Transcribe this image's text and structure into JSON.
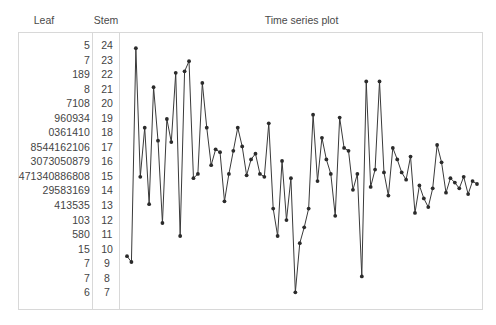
{
  "headers": {
    "leaf": "Leaf",
    "stem": "Stem",
    "plot_title": "Time series plot"
  },
  "stem_leaf": {
    "rows": [
      {
        "stem": "24",
        "leaf": "5"
      },
      {
        "stem": "23",
        "leaf": "7"
      },
      {
        "stem": "22",
        "leaf": "189"
      },
      {
        "stem": "21",
        "leaf": "8"
      },
      {
        "stem": "20",
        "leaf": "7108"
      },
      {
        "stem": "19",
        "leaf": "960934"
      },
      {
        "stem": "18",
        "leaf": "0361410"
      },
      {
        "stem": "17",
        "leaf": "8544162106"
      },
      {
        "stem": "16",
        "leaf": "3073050879"
      },
      {
        "stem": "15",
        "leaf": "471340886808"
      },
      {
        "stem": "14",
        "leaf": "29583169"
      },
      {
        "stem": "13",
        "leaf": "413535"
      },
      {
        "stem": "12",
        "leaf": "103"
      },
      {
        "stem": "11",
        "leaf": "580"
      },
      {
        "stem": "10",
        "leaf": "15"
      },
      {
        "stem": "9",
        "leaf": "7"
      },
      {
        "stem": "8",
        "leaf": "7"
      },
      {
        "stem": "7",
        "leaf": "6"
      }
    ]
  },
  "chart_data": {
    "type": "line",
    "title": "Time series plot",
    "xlabel": "",
    "ylabel": "",
    "grid": false,
    "legend": null,
    "marker": "filled-circle",
    "line_color": "#3a3a3a",
    "marker_color": "#2b2b2b",
    "ylim": [
      70,
      250
    ],
    "xlim": [
      1,
      80
    ],
    "x": [
      1,
      2,
      3,
      4,
      5,
      6,
      7,
      8,
      9,
      10,
      11,
      12,
      13,
      14,
      15,
      16,
      17,
      18,
      19,
      20,
      21,
      22,
      23,
      24,
      25,
      26,
      27,
      28,
      29,
      30,
      31,
      32,
      33,
      34,
      35,
      36,
      37,
      38,
      39,
      40,
      41,
      42,
      43,
      44,
      45,
      46,
      47,
      48,
      49,
      50,
      51,
      52,
      53,
      54,
      55,
      56,
      57,
      58,
      59,
      60,
      61,
      62,
      63,
      64,
      65,
      66,
      67,
      68,
      69,
      70,
      71,
      72,
      73,
      74,
      75,
      76,
      77,
      78,
      79,
      80
    ],
    "values": [
      101,
      97,
      245,
      156,
      190,
      137,
      218,
      181,
      124,
      196,
      180,
      228,
      115,
      229,
      236,
      155,
      158,
      221,
      190,
      164,
      175,
      173,
      139,
      158,
      174,
      190,
      177,
      157,
      168,
      172,
      158,
      156,
      193,
      134,
      115,
      167,
      126,
      155,
      76,
      110,
      121,
      134,
      199,
      153,
      183,
      168,
      158,
      129,
      197,
      176,
      174,
      147,
      158,
      87,
      222,
      149,
      161,
      222,
      159,
      143,
      176,
      168,
      159,
      154,
      170,
      131,
      150,
      141,
      135,
      148,
      178,
      166,
      145,
      155,
      152,
      148,
      156,
      144,
      153,
      151
    ]
  }
}
